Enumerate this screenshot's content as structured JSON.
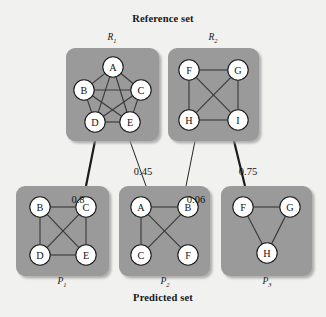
{
  "figure": {
    "top_title": "Reference set",
    "bottom_title": "Predicted set",
    "background_color": "#f1f1ef",
    "cluster_color": "#9a9a9a",
    "node_fill": "#ffffff",
    "node_stroke": "#1a1a1a",
    "edge_color": "#3a3a3a"
  },
  "reference_clusters": [
    {
      "id": "R1",
      "label": "R",
      "subscript": "1",
      "nodes": [
        "A",
        "B",
        "C",
        "D",
        "E"
      ],
      "edges": [
        [
          "A",
          "B"
        ],
        [
          "A",
          "C"
        ],
        [
          "B",
          "C"
        ],
        [
          "B",
          "D"
        ],
        [
          "C",
          "E"
        ],
        [
          "D",
          "E"
        ],
        [
          "A",
          "D"
        ],
        [
          "A",
          "E"
        ],
        [
          "B",
          "E"
        ],
        [
          "C",
          "D"
        ]
      ]
    },
    {
      "id": "R2",
      "label": "R",
      "subscript": "2",
      "nodes": [
        "F",
        "G",
        "H",
        "I"
      ],
      "edges": [
        [
          "F",
          "G"
        ],
        [
          "F",
          "H"
        ],
        [
          "G",
          "I"
        ],
        [
          "H",
          "I"
        ],
        [
          "F",
          "I"
        ],
        [
          "G",
          "H"
        ]
      ]
    }
  ],
  "predicted_clusters": [
    {
      "id": "P1",
      "label": "P",
      "subscript": "1",
      "nodes": [
        "B",
        "C",
        "D",
        "E"
      ],
      "edges": [
        [
          "B",
          "C"
        ],
        [
          "B",
          "D"
        ],
        [
          "C",
          "E"
        ],
        [
          "D",
          "E"
        ],
        [
          "B",
          "E"
        ],
        [
          "C",
          "D"
        ]
      ]
    },
    {
      "id": "P2",
      "label": "P",
      "subscript": "2",
      "nodes": [
        "A",
        "B",
        "C",
        "F"
      ],
      "edges": [
        [
          "A",
          "B"
        ],
        [
          "A",
          "C"
        ],
        [
          "A",
          "F"
        ],
        [
          "B",
          "C"
        ]
      ]
    },
    {
      "id": "P3",
      "label": "P",
      "subscript": "3",
      "nodes": [
        "F",
        "G",
        "H"
      ],
      "edges": [
        [
          "F",
          "G"
        ],
        [
          "F",
          "H"
        ],
        [
          "G",
          "H"
        ]
      ]
    }
  ],
  "matches": [
    {
      "from": "R1",
      "to": "P1",
      "weight": "0.8",
      "thick": true
    },
    {
      "from": "R1",
      "to": "P2",
      "weight": "0.45",
      "thick": false
    },
    {
      "from": "R2",
      "to": "P2",
      "weight": "0.06",
      "thick": false
    },
    {
      "from": "R2",
      "to": "P3",
      "weight": "0.75",
      "thick": true
    }
  ]
}
